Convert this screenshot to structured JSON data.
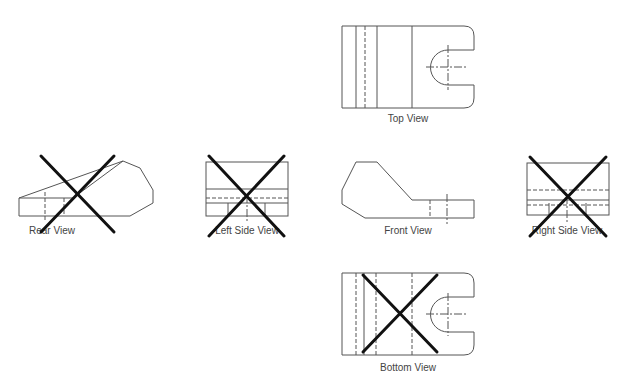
{
  "diagram": {
    "views": [
      {
        "id": "top",
        "label": "Top View",
        "crossed_out": false
      },
      {
        "id": "rear",
        "label": "Rear View",
        "crossed_out": true
      },
      {
        "id": "left",
        "label": "Left Side View",
        "crossed_out": true
      },
      {
        "id": "front",
        "label": "Front View",
        "crossed_out": false
      },
      {
        "id": "right",
        "label": "Right Side View",
        "crossed_out": true
      },
      {
        "id": "bottom",
        "label": "Bottom View",
        "crossed_out": true
      }
    ],
    "colors": {
      "line": "#555555",
      "cross": "#111111",
      "label": "#444444"
    }
  }
}
